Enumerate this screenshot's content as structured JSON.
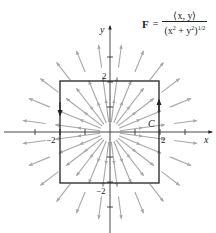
{
  "formula": {
    "lhs": "F",
    "equals": "=",
    "numerator": "⟨x, y⟩",
    "denominator_base": "(x",
    "denominator_exp1": "2",
    "denominator_mid": " + y",
    "denominator_exp2": "2",
    "denominator_close": ")",
    "denominator_exp3": "1/2"
  },
  "axes": {
    "x_label": "x",
    "y_label": "y",
    "x_tick_labels": [
      {
        "value": -2,
        "text": "−2"
      },
      {
        "value": 2,
        "text": "2"
      }
    ],
    "y_tick_labels": [
      {
        "value": 2,
        "text": "2"
      },
      {
        "value": -2,
        "text": "−2"
      }
    ],
    "ticks": [
      -3,
      -2,
      -1,
      1,
      2,
      3
    ]
  },
  "curve": {
    "label": "C",
    "shape": "square",
    "vertices": [
      [
        -2,
        -2
      ],
      [
        2,
        -2
      ],
      [
        2,
        2
      ],
      [
        -2,
        2
      ]
    ],
    "orientation": "counterclockwise"
  },
  "vector_field": {
    "type": "radial unit field",
    "ray_count": 24,
    "arrow_radii": [
      0.4,
      1.3,
      2.6
    ],
    "arrow_length": 0.9
  },
  "colors": {
    "axis": "#333333",
    "curve": "#222222",
    "arrows": "#a8a8a8"
  }
}
